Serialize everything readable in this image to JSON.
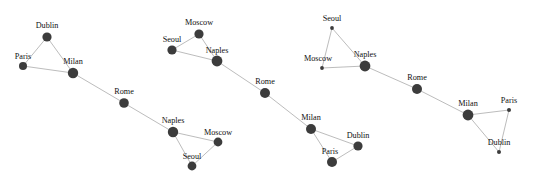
{
  "figure": {
    "title": "",
    "width": 536,
    "height": 181,
    "background_color": "#ffffff",
    "node_color": "#3c3c3c",
    "edge_color": "#b4b4b4",
    "label_color": "#111111"
  },
  "chart_data": {
    "type": "scatter",
    "title": "",
    "xlabel": "",
    "ylabel": "",
    "grid": false,
    "legend": "none",
    "graphs": [
      {
        "id": "graph-1",
        "nodes": [
          {
            "label": "Dublin",
            "x": 47,
            "y": 37,
            "r": 4.6,
            "label_dx": 0,
            "label_dy": -8
          },
          {
            "label": "Paris",
            "x": 23,
            "y": 66,
            "r": 4.0,
            "label_dx": 0,
            "label_dy": -7
          },
          {
            "label": "Milan",
            "x": 73,
            "y": 73,
            "r": 5.2,
            "label_dx": 0,
            "label_dy": -8
          },
          {
            "label": "Rome",
            "x": 124,
            "y": 103,
            "r": 4.8,
            "label_dx": 0,
            "label_dy": -8
          },
          {
            "label": "Naples",
            "x": 173,
            "y": 132,
            "r": 5.2,
            "label_dx": 0,
            "label_dy": -8
          },
          {
            "label": "Moscow",
            "x": 218,
            "y": 142,
            "r": 4.4,
            "label_dx": 0,
            "label_dy": -7
          },
          {
            "label": "Seoul",
            "x": 192,
            "y": 166,
            "r": 4.4,
            "label_dx": 0,
            "label_dy": -7
          }
        ],
        "edges": [
          [
            0,
            1
          ],
          [
            0,
            2
          ],
          [
            1,
            2
          ],
          [
            2,
            3
          ],
          [
            3,
            4
          ],
          [
            4,
            5
          ],
          [
            4,
            6
          ],
          [
            5,
            6
          ]
        ]
      },
      {
        "id": "graph-2",
        "nodes": [
          {
            "label": "Moscow",
            "x": 199,
            "y": 34,
            "r": 4.6,
            "label_dx": 0,
            "label_dy": -8
          },
          {
            "label": "Seoul",
            "x": 172,
            "y": 50,
            "r": 4.6,
            "label_dx": 0,
            "label_dy": -7
          },
          {
            "label": "Naples",
            "x": 217,
            "y": 61,
            "r": 5.4,
            "label_dx": 0,
            "label_dy": -7
          },
          {
            "label": "Rome",
            "x": 265,
            "y": 93,
            "r": 5.0,
            "label_dx": 0,
            "label_dy": -8
          },
          {
            "label": "Milan",
            "x": 311,
            "y": 129,
            "r": 5.0,
            "label_dx": 0,
            "label_dy": -8
          },
          {
            "label": "Dublin",
            "x": 358,
            "y": 146,
            "r": 4.6,
            "label_dx": 0,
            "label_dy": -7
          },
          {
            "label": "Paris",
            "x": 332,
            "y": 162,
            "r": 5.0,
            "label_dx": -2,
            "label_dy": -7
          }
        ],
        "edges": [
          [
            0,
            1
          ],
          [
            0,
            2
          ],
          [
            1,
            2
          ],
          [
            2,
            3
          ],
          [
            3,
            4
          ],
          [
            4,
            5
          ],
          [
            4,
            6
          ],
          [
            5,
            6
          ]
        ]
      },
      {
        "id": "graph-3",
        "nodes": [
          {
            "label": "Seoul",
            "x": 332,
            "y": 28,
            "r": 1.9,
            "label_dx": 0,
            "label_dy": -7
          },
          {
            "label": "Moscow",
            "x": 322,
            "y": 68,
            "r": 1.9,
            "label_dx": -4,
            "label_dy": -7
          },
          {
            "label": "Naples",
            "x": 365,
            "y": 66,
            "r": 5.4,
            "label_dx": 0,
            "label_dy": -8
          },
          {
            "label": "Rome",
            "x": 417,
            "y": 89,
            "r": 5.0,
            "label_dx": 0,
            "label_dy": -8
          },
          {
            "label": "Milan",
            "x": 468,
            "y": 115,
            "r": 5.4,
            "label_dx": 0,
            "label_dy": -8
          },
          {
            "label": "Paris",
            "x": 509,
            "y": 110,
            "r": 2.0,
            "label_dx": 0,
            "label_dy": -7
          },
          {
            "label": "Dublin",
            "x": 499,
            "y": 152,
            "r": 2.0,
            "label_dx": 0,
            "label_dy": -7
          }
        ],
        "edges": [
          [
            0,
            1
          ],
          [
            0,
            2
          ],
          [
            1,
            2
          ],
          [
            2,
            3
          ],
          [
            3,
            4
          ],
          [
            4,
            5
          ],
          [
            4,
            6
          ],
          [
            5,
            6
          ]
        ]
      }
    ]
  }
}
